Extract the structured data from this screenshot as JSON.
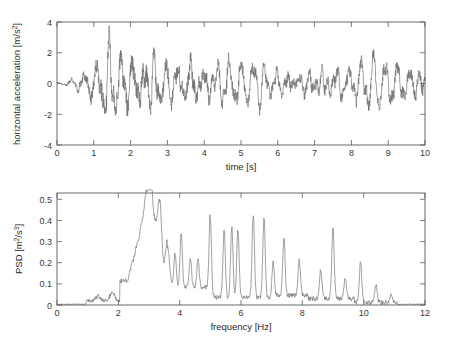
{
  "figure": {
    "background_color": "#ffffff",
    "axis_color": "#5a5a5a",
    "line_color": "#6e6e6e"
  },
  "chart_data": [
    {
      "id": "acceleration-timeseries",
      "type": "line",
      "title": "",
      "xlabel": "time [s]",
      "ylabel": "horizontal acceleration [m/s^2]",
      "ylabel_base": "horizontal acceleration [m/s",
      "ylabel_sup": "2",
      "ylabel_tail": "]",
      "xlim": [
        0,
        10
      ],
      "ylim": [
        -4,
        4
      ],
      "xticks": [
        0,
        1,
        2,
        3,
        4,
        5,
        6,
        7,
        8,
        9,
        10
      ],
      "xticklabels": [
        "0",
        "1",
        "2",
        "3",
        "4",
        "5",
        "6",
        "7",
        "8",
        "9",
        "10"
      ],
      "yticks": [
        -4,
        -2,
        0,
        2,
        4
      ],
      "yticklabels": [
        "-4",
        "-2",
        "0",
        "2",
        "4"
      ],
      "grid": false,
      "legend": null,
      "series": [
        {
          "name": "horizontal acceleration",
          "description": "amplitude-modulated oscillation: near zero at t=0, growing to about +/-3.5 between t=1.2 and t=1.7, sustained +/-2.5 to +/-3 until t=3.6, then reduced noisy oscillation of about +/-2 from t=4 to t=10",
          "sampling_note": "dense waveform, roughly 500 samples over 10 s"
        }
      ]
    },
    {
      "id": "psd-spectrum",
      "type": "line",
      "title": "",
      "xlabel": "frequency [Hz]",
      "ylabel": "PSD [m^2/s^3]",
      "ylabel_base": "PSD [m",
      "ylabel_sup1": "2",
      "ylabel_mid": "/s",
      "ylabel_sup2": "3",
      "ylabel_tail": "]",
      "xlim": [
        0,
        12
      ],
      "ylim": [
        0,
        0.53
      ],
      "xticks": [
        0,
        2,
        4,
        6,
        8,
        10,
        12
      ],
      "xticklabels": [
        "0",
        "2",
        "4",
        "6",
        "8",
        "10",
        "12"
      ],
      "yticks": [
        0,
        0.1,
        0.2,
        0.3,
        0.4,
        0.5
      ],
      "yticklabels": [
        "0",
        "0.1",
        "0.2",
        "0.3",
        "0.4",
        "0.5"
      ],
      "grid": false,
      "legend": null,
      "series": [
        {
          "name": "power spectral density",
          "description": "near zero below 1 Hz, small bump 1.2-2 Hz (~0.03-0.05), sharp rise after 2 Hz, broad maximum 2.5-3.5 Hz with tallest peak about 0.53 near 3.05 Hz, spiky peaks 5-7 Hz reaching 0.34-0.42, decaying peaks 7-11 Hz, near zero beyond 11 Hz",
          "peaks": [
            {
              "f": 1.35,
              "v": 0.03
            },
            {
              "f": 1.8,
              "v": 0.05
            },
            {
              "f": 2.45,
              "v": 0.13
            },
            {
              "f": 2.6,
              "v": 0.2
            },
            {
              "f": 2.75,
              "v": 0.29
            },
            {
              "f": 2.9,
              "v": 0.42
            },
            {
              "f": 3.05,
              "v": 0.53
            },
            {
              "f": 3.2,
              "v": 0.28
            },
            {
              "f": 3.35,
              "v": 0.42
            },
            {
              "f": 3.6,
              "v": 0.23
            },
            {
              "f": 3.85,
              "v": 0.2
            },
            {
              "f": 4.05,
              "v": 0.29
            },
            {
              "f": 4.35,
              "v": 0.17
            },
            {
              "f": 4.6,
              "v": 0.17
            },
            {
              "f": 5.0,
              "v": 0.38
            },
            {
              "f": 5.45,
              "v": 0.34
            },
            {
              "f": 5.7,
              "v": 0.35
            },
            {
              "f": 5.9,
              "v": 0.34
            },
            {
              "f": 6.4,
              "v": 0.41
            },
            {
              "f": 6.75,
              "v": 0.4
            },
            {
              "f": 7.05,
              "v": 0.18
            },
            {
              "f": 7.4,
              "v": 0.3
            },
            {
              "f": 7.9,
              "v": 0.19
            },
            {
              "f": 8.6,
              "v": 0.15
            },
            {
              "f": 9.0,
              "v": 0.36
            },
            {
              "f": 9.4,
              "v": 0.11
            },
            {
              "f": 9.9,
              "v": 0.2
            },
            {
              "f": 10.4,
              "v": 0.09
            },
            {
              "f": 10.9,
              "v": 0.05
            }
          ]
        }
      ]
    }
  ]
}
